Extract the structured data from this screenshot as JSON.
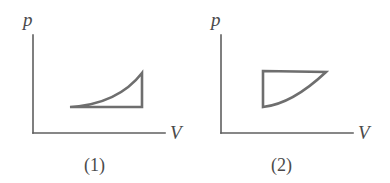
{
  "figure": {
    "background_color": "#ffffff",
    "stroke_color": "#6e6e6e",
    "axis_color": "#5f5f5f",
    "label_color": "#4a4a4a"
  },
  "panels": [
    {
      "id": "panel-1",
      "caption": "(1)",
      "y_axis_label": "p",
      "x_axis_label": "V",
      "shape_name": "concave-up-curved-triangle",
      "description": "Closed cycle: curve rising from lower-left to upper-right, vertical drop at right, horizontal return along the bottom",
      "origin": {
        "x": 33,
        "y": 133
      },
      "y_axis_top": 35,
      "x_axis_right": 165,
      "vertices": {
        "left_tip": {
          "x": 70,
          "y": 107
        },
        "apex_top": {
          "x": 142,
          "y": 73
        },
        "right_bottom": {
          "x": 142,
          "y": 107
        }
      },
      "curve_control": {
        "x": 118,
        "y": 104
      },
      "label_positions": {
        "y_label": {
          "x": 23,
          "y": 26
        },
        "x_label": {
          "x": 170,
          "y": 139
        },
        "caption": {
          "x": 84,
          "y": 171
        }
      }
    },
    {
      "id": "panel-2",
      "caption": "(2)",
      "y_axis_label": "p",
      "x_axis_label": "V",
      "shape_name": "concave-curved-quadrilateral",
      "description": "Closed cycle: flat top edge, vertical left edge, concave curve sweeping from the right apex down to the lower-left corner",
      "origin": {
        "x": 221,
        "y": 133
      },
      "y_axis_top": 35,
      "x_axis_right": 353,
      "vertices": {
        "top_left": {
          "x": 263,
          "y": 71
        },
        "top_right": {
          "x": 326,
          "y": 72
        },
        "bottom_left": {
          "x": 263,
          "y": 107
        }
      },
      "curve_control": {
        "x": 292,
        "y": 104
      },
      "label_positions": {
        "y_label": {
          "x": 211,
          "y": 26
        },
        "x_label": {
          "x": 358,
          "y": 139
        },
        "caption": {
          "x": 271,
          "y": 171
        }
      }
    }
  ]
}
